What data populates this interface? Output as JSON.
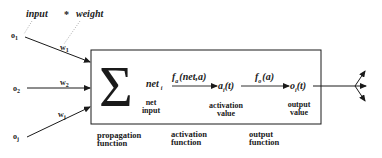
{
  "annotation": {
    "left": "input",
    "op": "*",
    "right": "weight"
  },
  "inputs": [
    {
      "label": "o",
      "sub": "1",
      "weight": "w",
      "weight_sub": "1"
    },
    {
      "label": "o",
      "sub": "2",
      "weight": "w",
      "weight_sub": "2"
    },
    {
      "label": "o",
      "sub": "j",
      "weight": "w",
      "weight_sub": "j"
    }
  ],
  "neuron": {
    "sum_symbol": "Σ",
    "net": {
      "symbol": "net",
      "sub": "i",
      "label_line1": "net",
      "label_line2": "input"
    },
    "activation_fn": {
      "f": "f",
      "sub": "a",
      "args": "(net,a)"
    },
    "activation": {
      "symbol": "a",
      "sub": "i",
      "arg": "(t)",
      "label_line1": "activation",
      "label_line2": "value"
    },
    "output_fn": {
      "f": "f",
      "sub": "o",
      "args": "(a)"
    },
    "output": {
      "symbol": "o",
      "sub": "i",
      "arg": "(t)",
      "label_line1": "output",
      "label_line2": "value"
    }
  },
  "functions": [
    {
      "line1": "propagation",
      "line2": "function"
    },
    {
      "line1": "activation",
      "line2": "function"
    },
    {
      "line1": "output",
      "line2": "function"
    }
  ],
  "colors": {
    "ink": "#1a1a1a",
    "background": "#ffffff",
    "dotted": "#999999"
  }
}
